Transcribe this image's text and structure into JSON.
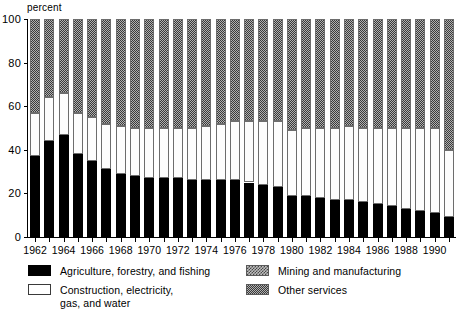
{
  "chart_data": {
    "type": "bar",
    "subtype": "stacked-100-percent",
    "title": "",
    "xlabel": "",
    "ylabel": "percent",
    "ylim": [
      0,
      100
    ],
    "yticks": [
      0,
      20,
      40,
      60,
      80,
      100
    ],
    "ytick_labels": [
      "0",
      "20",
      "40",
      "60",
      "80",
      "100"
    ],
    "grid": false,
    "legend_position": "below-plot",
    "axis_unit_label": "percent",
    "categories": [
      "1962",
      "1963",
      "1964",
      "1965",
      "1966",
      "1967",
      "1968",
      "1969",
      "1970",
      "1971",
      "1972",
      "1973",
      "1974",
      "1975",
      "1976",
      "1977",
      "1978",
      "1979",
      "1980",
      "1981",
      "1982",
      "1983",
      "1984",
      "1985",
      "1986",
      "1987",
      "1988",
      "1989",
      "1990",
      "1991"
    ],
    "xtick_labels": [
      "1962",
      "1964",
      "1966",
      "1968",
      "1970",
      "1972",
      "1974",
      "1976",
      "1978",
      "1980",
      "1982",
      "1984",
      "1986",
      "1988",
      "1990"
    ],
    "series": [
      {
        "name": "Agriculture, forestry, and fishing",
        "pattern": "solid-black",
        "color": "#000000",
        "values": [
          37,
          44,
          47,
          38,
          35,
          31,
          29,
          28,
          27,
          27,
          27,
          26,
          26,
          26,
          26,
          25,
          24,
          23,
          19,
          19,
          18,
          17,
          17,
          16,
          15,
          14,
          13,
          12,
          11,
          9
        ]
      },
      {
        "name": "Construction, electricity, gas, and water",
        "pattern": "solid-white",
        "color": "#ffffff",
        "values": [
          20,
          20,
          19,
          19,
          20,
          21,
          22,
          22,
          23,
          23,
          23,
          24,
          25,
          26,
          27,
          28,
          29,
          30,
          30,
          31,
          32,
          33,
          34,
          34,
          35,
          36,
          37,
          38,
          39,
          31
        ]
      },
      {
        "name": "Mining and manufacturing",
        "pattern": "coarse-checker",
        "color": "#bdbdbd",
        "values": [
          0,
          0,
          0,
          0,
          0,
          0,
          0,
          0,
          0,
          0,
          0,
          0,
          0,
          0,
          0,
          0,
          0,
          0,
          0,
          0,
          0,
          0,
          0,
          0,
          0,
          0,
          0,
          0,
          0,
          0
        ]
      },
      {
        "name": "Other services",
        "pattern": "fine-checker",
        "color": "#b0b0b0",
        "values": [
          43,
          36,
          34,
          43,
          45,
          48,
          49,
          50,
          50,
          50,
          50,
          50,
          49,
          48,
          47,
          47,
          47,
          47,
          51,
          50,
          50,
          50,
          49,
          50,
          50,
          50,
          50,
          50,
          50,
          60
        ]
      }
    ],
    "stack_boundaries": {
      "description": "Cumulative top of each segment from baseline 0, in percent",
      "agriculture_top": [
        37,
        44,
        47,
        38,
        35,
        31,
        29,
        28,
        27,
        27,
        27,
        26,
        26,
        26,
        26,
        25,
        24,
        23,
        19,
        19,
        18,
        17,
        17,
        16,
        15,
        14,
        13,
        12,
        11,
        9
      ],
      "construction_top": [
        57,
        64,
        66,
        57,
        55,
        52,
        51,
        50,
        50,
        50,
        50,
        50,
        51,
        52,
        53,
        53,
        53,
        53,
        49,
        50,
        50,
        50,
        51,
        50,
        50,
        50,
        50,
        50,
        50,
        40
      ],
      "mining_top": [
        57,
        64,
        66,
        57,
        55,
        52,
        51,
        50,
        50,
        50,
        50,
        50,
        51,
        52,
        53,
        53,
        53,
        53,
        49,
        50,
        50,
        50,
        51,
        50,
        50,
        50,
        50,
        50,
        50,
        40
      ],
      "services_top": [
        100,
        100,
        100,
        100,
        100,
        100,
        100,
        100,
        100,
        100,
        100,
        100,
        100,
        100,
        100,
        100,
        100,
        100,
        100,
        100,
        100,
        100,
        100,
        100,
        100,
        100,
        100,
        100,
        100,
        100
      ]
    }
  },
  "legend": {
    "items": [
      {
        "label": "Agriculture, forestry, and fishing",
        "swatch": "solid-black"
      },
      {
        "label_line1": "Construction, electricity,",
        "label_line2": "gas, and water",
        "swatch": "solid-white"
      },
      {
        "label": "Mining and manufacturing",
        "swatch": "coarse-checker"
      },
      {
        "label": "Other services",
        "swatch": "fine-checker"
      }
    ]
  }
}
